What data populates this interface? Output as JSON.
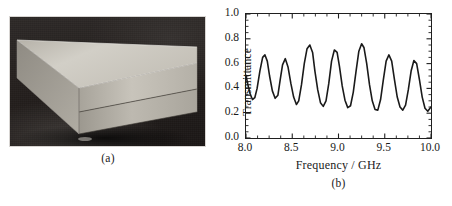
{
  "figure": {
    "panel_a": {
      "caption": "(a)",
      "photo": {
        "description": "photograph-of-wedge-shaped-ceramic-block",
        "background_color": "#231f1e",
        "block_top_color": "#cfccc4",
        "block_front_color": "#b9b5ac",
        "block_side_color": "#9b978e"
      }
    },
    "panel_b": {
      "caption": "(b)"
    }
  },
  "chart_data": {
    "type": "line",
    "title": "",
    "xlabel": "Frequency / GHz",
    "ylabel": "Transmittance",
    "xlim": [
      8.0,
      10.0
    ],
    "ylim": [
      0.0,
      1.0
    ],
    "xticks": [
      8.0,
      8.5,
      9.0,
      9.5,
      10.0
    ],
    "xtick_labels": [
      "8.0",
      "8.5",
      "9.0",
      "9.5",
      "10.0"
    ],
    "yticks": [
      0.0,
      0.2,
      0.4,
      0.6,
      0.8,
      1.0
    ],
    "ytick_labels": [
      "0.0",
      "0.2",
      "0.4",
      "0.6",
      "0.8",
      "1.0"
    ],
    "x_minor_tick_interval": 0.125,
    "y_minor_tick_interval": 0.05,
    "grid": false,
    "legend": false,
    "line_color": "#1a1a1a",
    "line_width": 1.6,
    "series": [
      {
        "name": "Transmittance",
        "x": [
          8.0,
          8.02,
          8.045,
          8.07,
          8.095,
          8.12,
          8.15,
          8.18,
          8.205,
          8.23,
          8.255,
          8.285,
          8.315,
          8.345,
          8.37,
          8.395,
          8.425,
          8.455,
          8.485,
          8.515,
          8.545,
          8.57,
          8.6,
          8.63,
          8.66,
          8.69,
          8.72,
          8.745,
          8.775,
          8.805,
          8.835,
          8.865,
          8.895,
          8.925,
          8.955,
          8.985,
          9.01,
          9.04,
          9.07,
          9.1,
          9.13,
          9.16,
          9.19,
          9.22,
          9.25,
          9.275,
          9.305,
          9.335,
          9.365,
          9.395,
          9.425,
          9.455,
          9.485,
          9.515,
          9.545,
          9.575,
          9.605,
          9.635,
          9.665,
          9.695,
          9.725,
          9.755,
          9.785,
          9.815,
          9.845,
          9.875,
          9.905,
          9.935,
          9.965,
          10.0
        ],
        "y": [
          0.505,
          0.43,
          0.355,
          0.31,
          0.325,
          0.4,
          0.54,
          0.65,
          0.67,
          0.62,
          0.5,
          0.38,
          0.32,
          0.345,
          0.47,
          0.59,
          0.64,
          0.57,
          0.44,
          0.33,
          0.27,
          0.3,
          0.43,
          0.6,
          0.72,
          0.75,
          0.69,
          0.54,
          0.39,
          0.285,
          0.255,
          0.3,
          0.44,
          0.62,
          0.71,
          0.69,
          0.58,
          0.42,
          0.305,
          0.245,
          0.26,
          0.37,
          0.54,
          0.7,
          0.76,
          0.73,
          0.6,
          0.43,
          0.3,
          0.23,
          0.225,
          0.31,
          0.47,
          0.62,
          0.67,
          0.62,
          0.47,
          0.33,
          0.25,
          0.225,
          0.265,
          0.39,
          0.54,
          0.625,
          0.6,
          0.47,
          0.33,
          0.24,
          0.215,
          0.25
        ]
      }
    ],
    "annotations": [
      "Oscillatory Fabry-Perot style interference fringes",
      "Peak transmittance decreases from ~0.76 near 9.25 GHz toward ~0.60 near 10.0 GHz",
      "Trough transmittance decreases from ~0.31 near 8.1 GHz toward ~0.18 near 9.8 GHz"
    ]
  }
}
